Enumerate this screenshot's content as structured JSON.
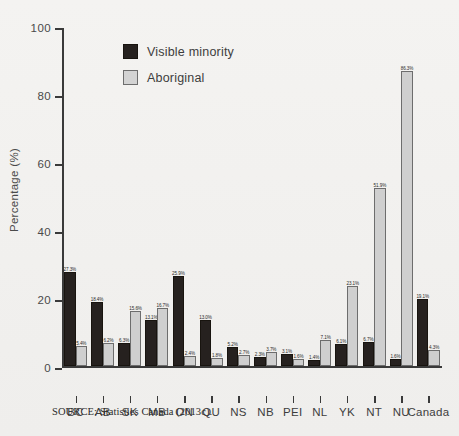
{
  "chart_data": {
    "type": "bar",
    "title": "",
    "subtitle": "",
    "xlabel": "",
    "ylabel": "Percentage (%)",
    "ylim": [
      0,
      100
    ],
    "yticks": [
      0,
      20,
      40,
      60,
      80,
      100
    ],
    "grid": false,
    "legend_position": "upper-left-inside",
    "categories": [
      "BC",
      "AB",
      "SK",
      "MB",
      "ON",
      "QU",
      "NS",
      "NB",
      "PEI",
      "NL",
      "YK",
      "NT",
      "NU",
      "Canada"
    ],
    "series": [
      {
        "name": "Visible minority",
        "color": "#26211f",
        "values": [
          27.3,
          18.4,
          6.3,
          13.1,
          25.9,
          13.0,
          5.2,
          2.3,
          3.1,
          1.4,
          6.1,
          6.7,
          1.6,
          19.1
        ],
        "labels": [
          "27.3%",
          "18.4%",
          "6.3%",
          "13.1%",
          "25.9%",
          "13.0%",
          "5.2%",
          "2.3%",
          "3.1%",
          "1.4%",
          "6.1%",
          "6.7%",
          "1.6%",
          "19.1%"
        ]
      },
      {
        "name": "Aboriginal",
        "color": "#cfcfcf",
        "values": [
          5.4,
          6.2,
          15.6,
          16.7,
          2.4,
          1.8,
          2.7,
          3.7,
          1.6,
          7.1,
          23.1,
          51.9,
          86.3,
          4.3
        ],
        "labels": [
          "5.4%",
          "6.2%",
          "15.6%",
          "16.7%",
          "2.4%",
          "1.8%",
          "2.7%",
          "3.7%",
          "1.6%",
          "7.1%",
          "23.1%",
          "51.9%",
          "86.3%",
          "4.3%"
        ]
      }
    ]
  },
  "legend": {
    "items": [
      {
        "label": "Visible minority",
        "swatch": "dark-swatch"
      },
      {
        "label": "Aboriginal",
        "swatch": "light-swatch"
      }
    ]
  },
  "source": {
    "text": "SOURCE: Statistics Canada (2013c)."
  },
  "colors": {
    "visible_minority": "#26211f",
    "aboriginal": "#cfcfcf",
    "axis": "#3a3a3a",
    "background": "#f2f1ef"
  }
}
